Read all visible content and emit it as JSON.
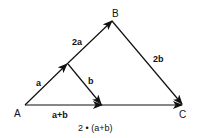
{
  "diagram": {
    "points": {
      "A": "A",
      "B": "B",
      "C": "C"
    },
    "vector_labels": {
      "a": "a",
      "two_a": "2a",
      "b": "b",
      "two_b": "2b",
      "a_plus_b": "a+b",
      "two_a_plus_b": "2 • (a+b)"
    }
  }
}
